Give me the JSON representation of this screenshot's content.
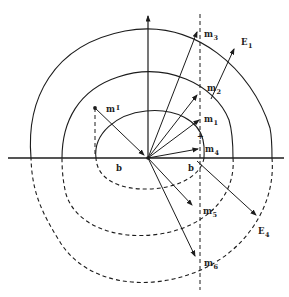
{
  "figure": {
    "background": "#ffffff",
    "ink_color": "#1c1c1c"
  },
  "labels": {
    "m_I": {
      "base": "m",
      "script": "I"
    },
    "m_1": {
      "base": "m",
      "script": "1"
    },
    "m_2": {
      "base": "m",
      "script": "2"
    },
    "m_3": {
      "base": "m",
      "script": "3"
    },
    "m_4": {
      "base": "m",
      "script": "4"
    },
    "m_5": {
      "base": "m",
      "script": "5"
    },
    "m_6": {
      "base": "m",
      "script": "6"
    },
    "E_1": {
      "base": "E",
      "script": "1"
    },
    "E_4": {
      "base": "E",
      "script": "4"
    },
    "b_left": "b",
    "b_right": "b",
    "center_mark": "+"
  }
}
